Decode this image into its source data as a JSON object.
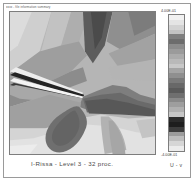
{
  "figure": {
    "header_note": "xxxx - file information summary",
    "caption": "I-Rissa - Level 3 -  32 proc.",
    "right_caption": "U - v"
  },
  "colorbar": {
    "max_label": "4.00E-01",
    "min_label": "-4.00E-01",
    "name": "colorbar",
    "bands": [
      "#f2f2f2",
      "#e4e4e4",
      "#d2d2d2",
      "#c2c2c2",
      "#7e7e7e",
      "#6d6d6d",
      "#8c8c8c",
      "#9b9b9b",
      "#ababab",
      "#b9b9b9",
      "#c8c8c8",
      "#a4a4a4",
      "#8f8f8f",
      "#7a7a7a",
      "#686868",
      "#5a5a5a",
      "#6f6f6f",
      "#898989",
      "#9e9e9e",
      "#b0b0b0",
      "#c6c6c6",
      "#2b2b2b",
      "#1e1e1e",
      "#3d3d3d",
      "#9c9c9c",
      "#bdbdbd",
      "#d6d6d6",
      "#ececec"
    ]
  },
  "chart_data": {
    "type": "heatmap",
    "title": "I-Rissa - Level 3 -  32 proc.",
    "subtitle": "U - v",
    "xlabel": "",
    "ylabel": "",
    "colormap": "grayscale",
    "grid": false,
    "legend_position": "right",
    "colorbar_ticks": [
      "4.00E-01",
      "-4.00E-01"
    ],
    "zlim": [
      -0.4,
      0.4
    ],
    "n_contour_levels": 28,
    "features": [
      {
        "name": "leading-edge-shock-pair",
        "region": "upper-left",
        "value": 0.4,
        "shade": "#f2f2f2"
      },
      {
        "name": "dark-shear-layer",
        "region": "upper-left-diagonal",
        "value": -0.38,
        "shade": "#1e1e1e"
      },
      {
        "name": "upper-dark-wedge",
        "region": "top-center",
        "value": -0.22,
        "shade": "#5f5f5f"
      },
      {
        "name": "stagnation-point",
        "region": "center",
        "value": 0.0,
        "shade": "#9a9a9a"
      },
      {
        "name": "lower-dark-lobe",
        "region": "lower-left-center",
        "value": -0.18,
        "shade": "#6b6b6b"
      },
      {
        "name": "lower-bright-field",
        "region": "bottom",
        "value": 0.3,
        "shade": "#e0e0e0"
      },
      {
        "name": "right-gradient-band",
        "region": "right",
        "value": 0.1,
        "shade": "#c4c4c4"
      }
    ]
  }
}
